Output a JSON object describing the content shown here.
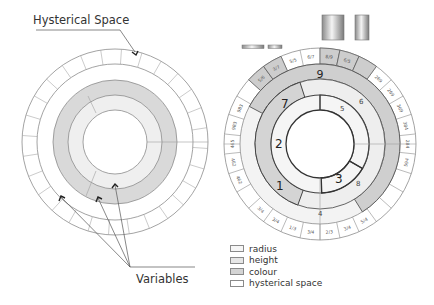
{
  "left_diagram": {
    "callouts": {
      "top_label": "Hysterical Space",
      "bottom_label": "Variables"
    }
  },
  "right_diagram": {
    "inner_ring_segments": [
      "5",
      "2",
      "3"
    ],
    "middle_ring_segments": [
      "7",
      "6",
      "1",
      "8",
      "4"
    ],
    "outer_band_label": "9",
    "outer_ticks_left": [
      "983",
      "983",
      "465",
      "462",
      "462"
    ],
    "outer_ticks_right": [
      "269",
      "269",
      "369",
      "384",
      "284",
      "594"
    ],
    "outer_ticks_top": [
      "5/6",
      "3/7",
      "5/5",
      "6/7",
      "8/9",
      "6/5"
    ],
    "outer_ticks_bottom": [
      "3/4",
      "3/4",
      "1/3",
      "3/4",
      "2/3",
      "3/4",
      "5/4"
    ]
  },
  "legend": {
    "items": [
      {
        "label": "radius",
        "color": "#f6f6f6"
      },
      {
        "label": "height",
        "color": "#e6e6e6"
      },
      {
        "label": "colour",
        "color": "#d4d4d4"
      },
      {
        "label": "hysterical space",
        "color": "#ffffff"
      }
    ]
  },
  "colors": {
    "stroke": "#8c8c8c",
    "dark_stroke": "#333333",
    "band_dark": "#cfcfcf",
    "band_mid": "#e3e3e3",
    "band_light": "#f1f1f1"
  }
}
